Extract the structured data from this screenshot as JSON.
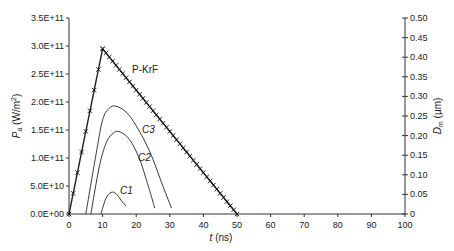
{
  "chart_data": {
    "type": "line",
    "title": "",
    "xlabel": "t (ns)",
    "ylabel": "Pa (W/m2)",
    "ylabel_right": "Dm (µm)",
    "xlim": [
      0,
      100
    ],
    "ylim": [
      0,
      350000000000.0
    ],
    "ylim_right": [
      0,
      0.5
    ],
    "x_ticks": [
      "0",
      "10",
      "20",
      "30",
      "40",
      "50",
      "60",
      "70",
      "80",
      "90",
      "100"
    ],
    "y_ticks": [
      "0.0E+00",
      "5.0E+10",
      "1.0E+11",
      "1.5E+11",
      "2.0E+11",
      "2.5E+11",
      "3.0E+11",
      "3.5E+11"
    ],
    "y_ticks_right": [
      "0",
      "0.05",
      "0.10",
      "0.15",
      "0.20",
      "0.25",
      "0.30",
      "0.35",
      "0.40",
      "0.45",
      "0.50"
    ],
    "grid": false,
    "series": [
      {
        "name": "P-KrF",
        "axis": "left",
        "marker": "x",
        "x": [
          0,
          10,
          50
        ],
        "values": [
          0,
          295000000000.0,
          0
        ]
      },
      {
        "name": "C3",
        "axis": "right",
        "x": [
          5,
          8,
          10,
          12,
          14,
          17,
          20,
          24,
          28,
          30.5
        ],
        "values": [
          0,
          0.15,
          0.24,
          0.27,
          0.275,
          0.26,
          0.225,
          0.16,
          0.07,
          0.015
        ]
      },
      {
        "name": "C2",
        "axis": "right",
        "x": [
          6.5,
          9,
          11,
          13,
          15,
          18,
          21,
          24,
          25.5
        ],
        "values": [
          0,
          0.12,
          0.18,
          0.205,
          0.21,
          0.19,
          0.14,
          0.06,
          0.015
        ]
      },
      {
        "name": "C1",
        "axis": "right",
        "x": [
          9.5,
          11,
          12.5,
          14,
          15.5,
          17
        ],
        "values": [
          0,
          0.04,
          0.055,
          0.052,
          0.035,
          0.02
        ]
      }
    ],
    "annotations": [
      {
        "text": "P-KrF",
        "x": 16,
        "y": 270000000000.0
      },
      {
        "text": "C3",
        "x": 22,
        "y": 0.24
      },
      {
        "text": "C2",
        "x": 20,
        "y": 0.155
      },
      {
        "text": "C1",
        "x": 15,
        "y": 0.065
      }
    ]
  },
  "labels": {
    "xlabel_t": "t",
    "xlabel_unit": " (ns)",
    "ylabel_P": "P",
    "ylabel_sub": "a",
    "ylabel_unit": " (W/m",
    "ylabel_sup": "2",
    "ylabel_close": ")",
    "yr_D": "D",
    "yr_sub": "m",
    "yr_unit": " (µm)",
    "pkrf": "P-KrF",
    "c1": "C1",
    "c2": "C2",
    "c3": "C3"
  }
}
